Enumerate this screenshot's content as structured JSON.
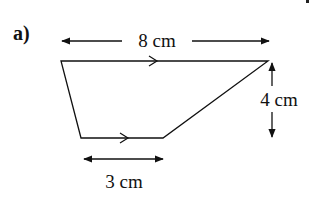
{
  "diagram": {
    "part_label": "a)",
    "shape": "trapezium",
    "dimensions": {
      "top_length": "8 cm",
      "bottom_length": "3 cm",
      "height": "4 cm"
    },
    "parallel_markers": [
      "top-edge",
      "bottom-edge"
    ],
    "colors": {
      "line": "#111111",
      "background": "#ffffff"
    }
  }
}
